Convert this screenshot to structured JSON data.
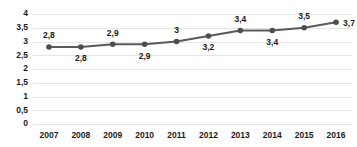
{
  "chart_data": {
    "type": "line",
    "title": "",
    "subtitle": "",
    "xlabel": "",
    "ylabel": "",
    "categories": [
      "2007",
      "2008",
      "2009",
      "2010",
      "2011",
      "2012",
      "2013",
      "2014",
      "2015",
      "2016"
    ],
    "values": [
      2.8,
      2.8,
      2.9,
      2.9,
      3.0,
      3.2,
      3.4,
      3.4,
      3.5,
      3.7
    ],
    "point_labels": [
      "2,8",
      "2,8",
      "2,9",
      "2,9",
      "3",
      "3,2",
      "3,4",
      "3,4",
      "3,5",
      "3,7"
    ],
    "point_label_positions": [
      "above",
      "below",
      "above",
      "below",
      "above",
      "below",
      "above",
      "below",
      "above",
      "right"
    ],
    "ylim": [
      0,
      4
    ],
    "ytick_values": [
      0,
      0.5,
      1,
      1.5,
      2,
      2.5,
      3,
      3.5,
      4
    ],
    "ytick_labels": [
      "0",
      "0,5",
      "1",
      "1,5",
      "2",
      "2,5",
      "3",
      "3,5",
      "4"
    ],
    "grid": true,
    "grid_axis": "y",
    "legend": false,
    "legend_position": "none",
    "series_color": "#5a5a5a",
    "marker_color": "#4d4d4d",
    "grid_color": "#e6e6e6",
    "background_color": "#ffffff",
    "text_color": "#1a1a1a",
    "marker_style": "circle"
  }
}
